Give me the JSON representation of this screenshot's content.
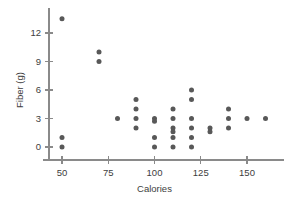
{
  "chart_data": {
    "type": "scatter",
    "title": "",
    "xlabel": "Calories",
    "ylabel": "Fiber (g)",
    "xlim": [
      38,
      170
    ],
    "ylim": [
      -0.9,
      14.6
    ],
    "grid": false,
    "legend": null,
    "xticks": [
      50,
      75,
      100,
      125,
      150
    ],
    "xtick_labels": [
      "50",
      "75",
      "100",
      "125",
      "150"
    ],
    "yticks": [
      0,
      3,
      6,
      9,
      12
    ],
    "ytick_labels": [
      "0",
      "3",
      "6",
      "9",
      "12"
    ],
    "point_color": "#585858",
    "axis_color": "#8a8a8a",
    "marker": "circle",
    "marker_radius": 2.5,
    "points": [
      {
        "x": 50,
        "y": 13.5
      },
      {
        "x": 50,
        "y": 1
      },
      {
        "x": 50,
        "y": 0
      },
      {
        "x": 70,
        "y": 10
      },
      {
        "x": 70,
        "y": 9
      },
      {
        "x": 80,
        "y": 3
      },
      {
        "x": 90,
        "y": 5
      },
      {
        "x": 90,
        "y": 4
      },
      {
        "x": 90,
        "y": 3
      },
      {
        "x": 90,
        "y": 2
      },
      {
        "x": 100,
        "y": 3
      },
      {
        "x": 100,
        "y": 2.7
      },
      {
        "x": 100,
        "y": 1
      },
      {
        "x": 100,
        "y": 0
      },
      {
        "x": 110,
        "y": 4
      },
      {
        "x": 110,
        "y": 3
      },
      {
        "x": 110,
        "y": 2
      },
      {
        "x": 110,
        "y": 1.6
      },
      {
        "x": 110,
        "y": 1
      },
      {
        "x": 110,
        "y": 0
      },
      {
        "x": 120,
        "y": 6
      },
      {
        "x": 120,
        "y": 5
      },
      {
        "x": 120,
        "y": 3
      },
      {
        "x": 120,
        "y": 2
      },
      {
        "x": 120,
        "y": 1
      },
      {
        "x": 120,
        "y": 0
      },
      {
        "x": 130,
        "y": 2
      },
      {
        "x": 130,
        "y": 1.6
      },
      {
        "x": 140,
        "y": 4
      },
      {
        "x": 140,
        "y": 3
      },
      {
        "x": 140,
        "y": 2
      },
      {
        "x": 150,
        "y": 3
      },
      {
        "x": 160,
        "y": 3
      }
    ]
  }
}
